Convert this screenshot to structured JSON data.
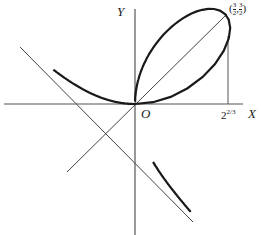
{
  "figure": {
    "curve": "x^3 + y^3 = 3xy",
    "asymptote": "x + y + 1 = 0",
    "symmetry_line": "y = x",
    "labels": {
      "x_axis": "X",
      "y_axis": "Y",
      "origin": "O",
      "tick": "2",
      "tick_exp": "2/3",
      "point_open": "(",
      "point_x_num": "3",
      "point_x_den": "2",
      "point_sep": ",",
      "point_y_num": "3",
      "point_y_den": "2",
      "point_close": ")"
    },
    "origin_px": [
      135,
      104
    ],
    "scale_px_per_unit": 60,
    "colors": {
      "curve": "#1a1a1a",
      "lines": "#444444",
      "background": "#ffffff"
    }
  }
}
